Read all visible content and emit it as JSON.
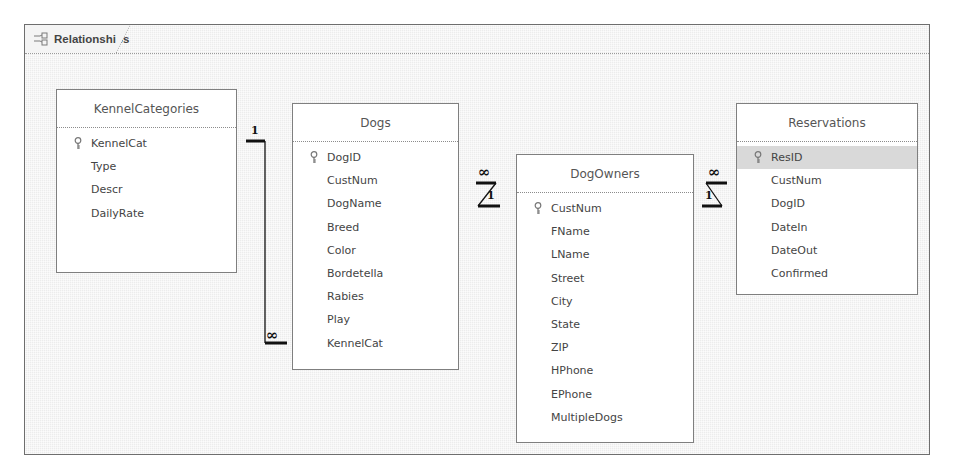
{
  "window": {
    "tab_label": "Relationships",
    "tab_icon": "relationships-icon"
  },
  "tables": [
    {
      "name": "KennelCategories",
      "fields": [
        "KennelCat",
        "Type",
        "Descr",
        "DailyRate"
      ],
      "primary_key": "KennelCat"
    },
    {
      "name": "Dogs",
      "fields": [
        "DogID",
        "CustNum",
        "DogName",
        "Breed",
        "Color",
        "Bordetella",
        "Rabies",
        "Play",
        "KennelCat"
      ],
      "primary_key": "DogID"
    },
    {
      "name": "DogOwners",
      "fields": [
        "CustNum",
        "FName",
        "LName",
        "Street",
        "City",
        "State",
        "ZIP",
        "HPhone",
        "EPhone",
        "MultipleDogs"
      ],
      "primary_key": "CustNum"
    },
    {
      "name": "Reservations",
      "fields": [
        "ResID",
        "CustNum",
        "DogID",
        "DateIn",
        "DateOut",
        "Confirmed"
      ],
      "primary_key": "ResID",
      "selected_field": "ResID"
    }
  ],
  "relationships": [
    {
      "from": "KennelCategories.KennelCat",
      "to": "Dogs.KennelCat",
      "one_label": "1",
      "many_label": "∞"
    },
    {
      "from": "DogOwners.CustNum",
      "to": "Dogs.CustNum",
      "one_label": "1",
      "many_label": "∞"
    },
    {
      "from": "DogOwners.CustNum",
      "to": "Reservations.CustNum",
      "one_label": "1",
      "many_label": "∞"
    }
  ],
  "colors": {
    "frame_border": "#6e6e6e",
    "background": "#ececec",
    "table_border": "#7f7f7f",
    "selected_row": "#d9d9d9",
    "text": "#444444"
  }
}
